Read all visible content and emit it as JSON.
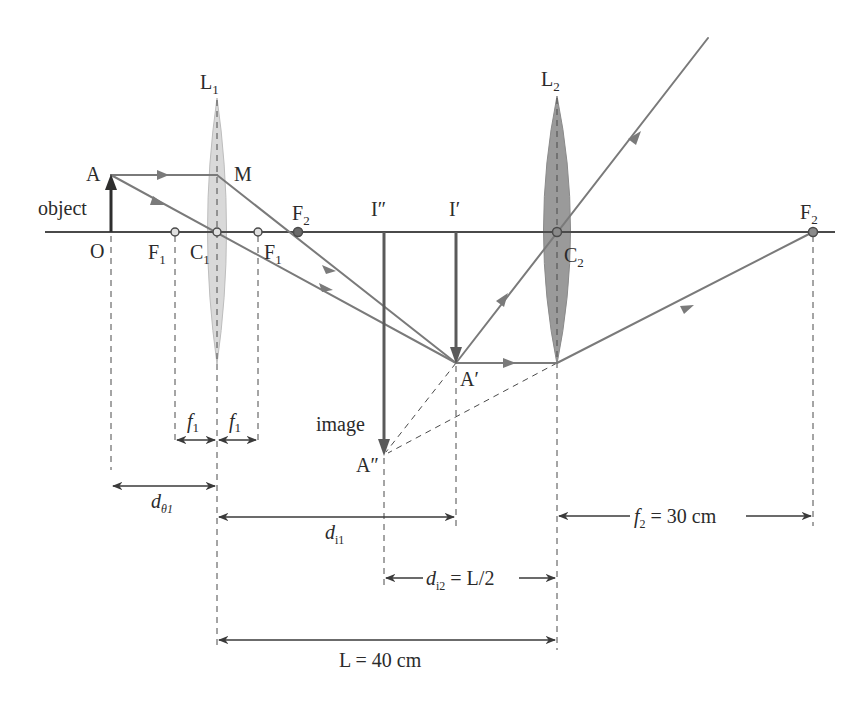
{
  "colors": {
    "axis": "#4a4a4a",
    "ray": "#7a7a7a",
    "arrow": "#3a3a3a",
    "lens1_fill": "#d9d9d9",
    "lens2_fill": "#9a9a9a",
    "text": "#2b2b2b"
  },
  "lenses": {
    "l1": {
      "label": "L",
      "sub": "1",
      "center_label": "C",
      "center_sub": "1"
    },
    "l2": {
      "label": "L",
      "sub": "2",
      "center_label": "C",
      "center_sub": "2"
    }
  },
  "points": {
    "object_top": "A",
    "object_base": "O",
    "ray_point": "M",
    "focus_left_1": {
      "label": "F",
      "sub": "1"
    },
    "focus_right_1": {
      "label": "F",
      "sub": "1"
    },
    "focus_l2_near": {
      "label": "F",
      "sub": "2"
    },
    "focus_l2_far": {
      "label": "F",
      "sub": "2"
    },
    "first_image_base": "I′",
    "first_image_tip": "A′",
    "final_image_base": "I″",
    "final_image_tip": "A″"
  },
  "labels": {
    "object": "object",
    "image": "image"
  },
  "dimensions": {
    "f1_left": {
      "sym": "f",
      "sub": "1"
    },
    "f1_right": {
      "sym": "f",
      "sub": "1"
    },
    "do1": {
      "sym": "d",
      "sub": "θ1"
    },
    "di1": {
      "sym": "d",
      "sub": "i1"
    },
    "di2": {
      "sym": "d",
      "sub": "i2",
      "rest": " = L/2"
    },
    "f2": {
      "sym": "f",
      "sub": "2",
      "rest": " = 30 cm"
    },
    "L": {
      "text": "L = 40 cm"
    }
  }
}
